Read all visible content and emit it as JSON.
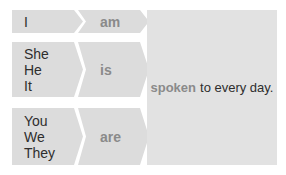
{
  "rows": [
    {
      "pronouns": [
        "I"
      ],
      "verb": "am"
    },
    {
      "pronouns": [
        "She",
        "He",
        "It"
      ],
      "verb": "is"
    },
    {
      "pronouns": [
        "You",
        "We",
        "They"
      ],
      "verb": "are"
    }
  ],
  "target": {
    "highlight": "spoken",
    "rest": "to every day."
  },
  "colors": {
    "cell_bg": "#dcdcdc",
    "verb_text": "#8a8a8a",
    "text": "#2e2e2e"
  }
}
